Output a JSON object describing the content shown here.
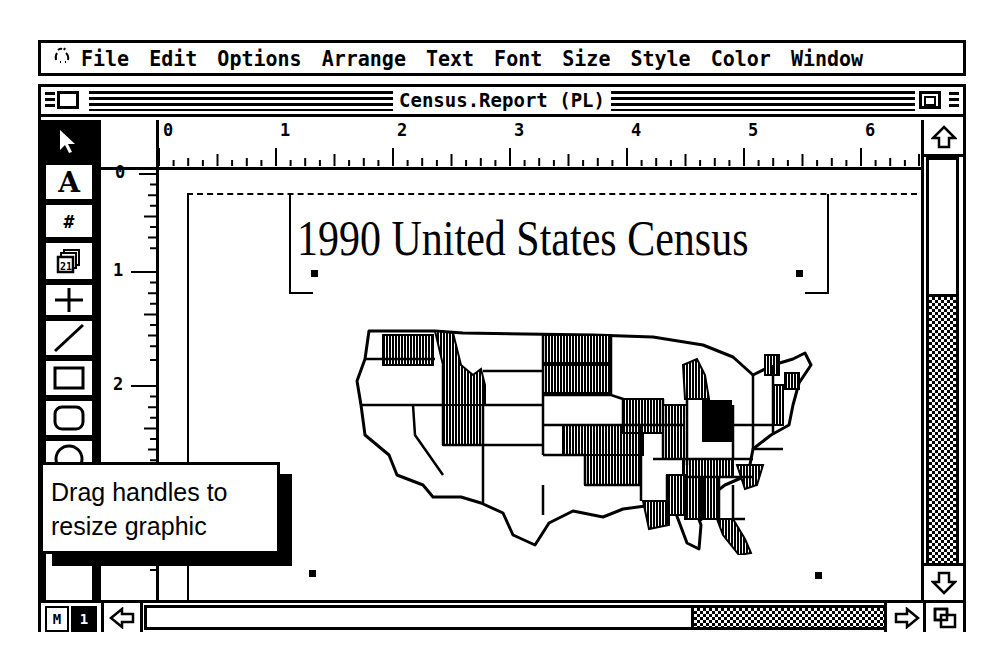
{
  "menubar": {
    "apple_icon": "rainbow-apple-icon",
    "items": [
      "File",
      "Edit",
      "Options",
      "Arrange",
      "Text",
      "Font",
      "Size",
      "Style",
      "Color",
      "Window"
    ]
  },
  "window": {
    "title": "Census.Report (PL)",
    "close_box_icon": "close-box-icon",
    "zoom_box_icon": "zoom-box-icon"
  },
  "tools": [
    {
      "name": "pointer",
      "icon": "arrow-pointer-icon",
      "glyph": "➤",
      "selected": true
    },
    {
      "name": "text",
      "icon": "text-tool-icon",
      "glyph": "A",
      "selected": false
    },
    {
      "name": "page-number",
      "icon": "page-number-icon",
      "glyph": "#",
      "selected": false
    },
    {
      "name": "date",
      "icon": "calendar-icon",
      "glyph": "21",
      "selected": false
    },
    {
      "name": "crosshair",
      "icon": "crosshair-icon",
      "glyph": "+",
      "selected": false
    },
    {
      "name": "line",
      "icon": "line-tool-icon",
      "glyph": "/",
      "selected": false
    },
    {
      "name": "rectangle",
      "icon": "rectangle-tool-icon",
      "glyph": "▭",
      "selected": false
    },
    {
      "name": "rounded-rectangle",
      "icon": "rounded-rectangle-tool-icon",
      "glyph": "▢",
      "selected": false
    },
    {
      "name": "oval",
      "icon": "oval-tool-icon",
      "glyph": "◯",
      "selected": false
    }
  ],
  "ruler": {
    "horizontal_labels": [
      "0",
      "1",
      "2",
      "3",
      "4",
      "5",
      "6"
    ],
    "vertical_labels": [
      "0",
      "1",
      "2"
    ],
    "unit": "inches"
  },
  "document": {
    "headline": "1990 United States Census",
    "graphic": "us-map-graphic"
  },
  "status": {
    "master_page_label": "M",
    "page_number": "1"
  },
  "callout": {
    "line1": "Drag handles to",
    "line2": "resize graphic"
  },
  "scrollbars": {
    "up_icon": "scroll-up-arrow-icon",
    "down_icon": "scroll-down-arrow-icon",
    "left_icon": "scroll-left-arrow-icon",
    "right_icon": "scroll-right-arrow-icon",
    "grow_icon": "grow-box-icon"
  }
}
